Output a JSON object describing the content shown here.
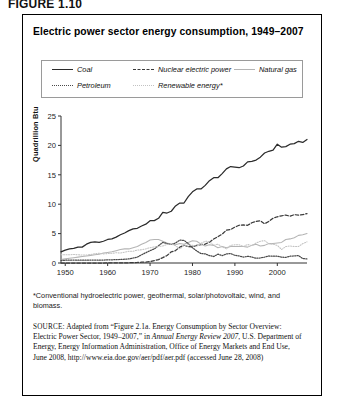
{
  "figure_label": "FIGURE 1.10",
  "chart_title": "Electric power sector energy consumption, 1949–2007",
  "legend": {
    "items": [
      {
        "label": "Coal",
        "style": "solid",
        "color": "#2b2b2b"
      },
      {
        "label": "Nuclear electric power",
        "style": "dashed",
        "color": "#3a3a3a"
      },
      {
        "label": "Natural gas",
        "style": "solid-gray",
        "color": "#b4b4b4"
      },
      {
        "label": "Petroleum",
        "style": "dotted",
        "color": "#4a4a4a"
      },
      {
        "label": "Renewable energy*",
        "style": "dotted-gray",
        "color": "#c2c2c2"
      }
    ]
  },
  "footnote": "*Conventional hydroelectric power, geothermal, solar/photovoltaic, wind, and biomass.",
  "source": {
    "prefix": "SOURCE",
    "text": ": Adapted from “Figure 2.1a. Energy Consumption by Sector Overview: Electric Power Sector, 1949–2007,” in ",
    "italic1": "Annual Energy Review 2007",
    "text2": ", U.S. Department of Energy, Energy Information Administration, Office of Energy Markets and End Use, June 2008, http://www.eia.doe.gov/aer/pdf/aer.pdf (accessed June 28, 2008)"
  },
  "chart_data": {
    "type": "line",
    "title": "Electric power sector energy consumption, 1949–2007",
    "xlabel": "",
    "ylabel": "Quadrillion Btu",
    "xlim": [
      1949,
      2007
    ],
    "ylim": [
      0,
      25
    ],
    "yticks": [
      0,
      5,
      10,
      15,
      20,
      25
    ],
    "xticks": [
      1950,
      1960,
      1970,
      1980,
      1990,
      2000
    ],
    "grid": false,
    "legend_position": "top",
    "x": [
      1949,
      1950,
      1951,
      1952,
      1953,
      1954,
      1955,
      1956,
      1957,
      1958,
      1959,
      1960,
      1961,
      1962,
      1963,
      1964,
      1965,
      1966,
      1967,
      1968,
      1969,
      1970,
      1971,
      1972,
      1973,
      1974,
      1975,
      1976,
      1977,
      1978,
      1979,
      1980,
      1981,
      1982,
      1983,
      1984,
      1985,
      1986,
      1987,
      1988,
      1989,
      1990,
      1991,
      1992,
      1993,
      1994,
      1995,
      1996,
      1997,
      1998,
      1999,
      2000,
      2001,
      2002,
      2003,
      2004,
      2005,
      2006,
      2007
    ],
    "series": [
      {
        "name": "Coal",
        "style": "solid",
        "color": "#2b2b2b",
        "values": [
          1.9,
          2.2,
          2.4,
          2.5,
          2.7,
          2.7,
          3.2,
          3.5,
          3.6,
          3.5,
          3.7,
          4.0,
          4.1,
          4.4,
          4.8,
          5.1,
          5.5,
          5.8,
          5.9,
          6.3,
          6.6,
          7.2,
          7.2,
          7.6,
          8.6,
          8.5,
          8.8,
          9.7,
          10.2,
          10.2,
          11.3,
          12.1,
          12.6,
          12.6,
          13.2,
          14.0,
          14.5,
          14.5,
          15.2,
          16.0,
          16.4,
          16.3,
          16.2,
          16.5,
          17.2,
          17.3,
          17.5,
          18.0,
          18.7,
          19.0,
          19.2,
          20.2,
          19.7,
          19.8,
          20.2,
          20.3,
          20.7,
          20.5,
          21.0
        ]
      },
      {
        "name": "Nuclear electric power",
        "style": "dashed",
        "color": "#3a3a3a",
        "values": [
          0,
          0,
          0,
          0,
          0,
          0,
          0,
          0,
          0,
          0,
          0,
          0.01,
          0.02,
          0.03,
          0.04,
          0.04,
          0.04,
          0.06,
          0.09,
          0.14,
          0.15,
          0.24,
          0.41,
          0.58,
          0.91,
          1.27,
          1.9,
          2.11,
          2.7,
          3.02,
          2.78,
          2.74,
          3.01,
          3.13,
          3.2,
          3.55,
          4.08,
          4.47,
          4.91,
          5.59,
          5.68,
          6.1,
          6.42,
          6.48,
          6.41,
          6.84,
          7.08,
          7.17,
          6.68,
          7.07,
          7.61,
          7.86,
          8.03,
          8.15,
          7.96,
          8.22,
          8.16,
          8.21,
          8.41
        ]
      },
      {
        "name": "Natural gas",
        "style": "solid-gray",
        "color": "#b4b4b4",
        "values": [
          0.6,
          0.7,
          0.8,
          0.9,
          1.0,
          1.1,
          1.2,
          1.3,
          1.4,
          1.5,
          1.7,
          1.8,
          1.9,
          2.1,
          2.3,
          2.4,
          2.4,
          2.6,
          2.8,
          3.2,
          3.5,
          3.9,
          4.0,
          4.0,
          3.7,
          3.4,
          3.2,
          3.1,
          3.3,
          3.2,
          3.5,
          3.8,
          3.7,
          3.2,
          2.9,
          3.1,
          3.0,
          2.6,
          2.8,
          2.6,
          2.8,
          2.8,
          2.8,
          2.8,
          2.7,
          3.0,
          3.2,
          2.9,
          3.0,
          3.3,
          3.3,
          3.4,
          3.5,
          4.0,
          4.1,
          4.3,
          4.7,
          4.8,
          5.0
        ]
      },
      {
        "name": "Petroleum",
        "style": "dotted",
        "color": "#4a4a4a",
        "values": [
          0.46,
          0.47,
          0.48,
          0.5,
          0.48,
          0.47,
          0.47,
          0.5,
          0.5,
          0.48,
          0.5,
          0.55,
          0.55,
          0.57,
          0.6,
          0.65,
          0.7,
          0.85,
          1.0,
          1.4,
          1.75,
          2.1,
          2.4,
          2.95,
          3.5,
          3.3,
          3.15,
          3.4,
          3.9,
          3.85,
          3.3,
          2.6,
          2.05,
          1.6,
          1.55,
          1.25,
          1.1,
          1.5,
          1.25,
          1.55,
          1.6,
          1.3,
          1.2,
          1.0,
          1.15,
          1.0,
          0.8,
          0.85,
          1.0,
          1.2,
          1.15,
          1.15,
          1.0,
          0.95,
          1.15,
          1.2,
          1.25,
          0.75,
          0.7
        ]
      },
      {
        "name": "Renewable energy*",
        "style": "dotted-gray",
        "color": "#c2c2c2",
        "values": [
          1.4,
          1.4,
          1.4,
          1.45,
          1.4,
          1.35,
          1.35,
          1.45,
          1.6,
          1.65,
          1.55,
          1.6,
          1.65,
          1.75,
          1.7,
          1.85,
          2.0,
          2.0,
          2.2,
          2.25,
          2.4,
          2.6,
          2.75,
          2.8,
          2.9,
          3.15,
          3.2,
          2.95,
          2.4,
          2.95,
          3.1,
          3.0,
          2.85,
          3.35,
          3.7,
          3.65,
          3.0,
          3.2,
          2.75,
          2.4,
          3.0,
          3.1,
          3.1,
          2.8,
          3.15,
          2.95,
          3.4,
          3.7,
          3.8,
          3.3,
          3.2,
          3.0,
          2.3,
          2.8,
          2.9,
          2.8,
          2.8,
          3.3,
          3.6
        ]
      }
    ]
  }
}
